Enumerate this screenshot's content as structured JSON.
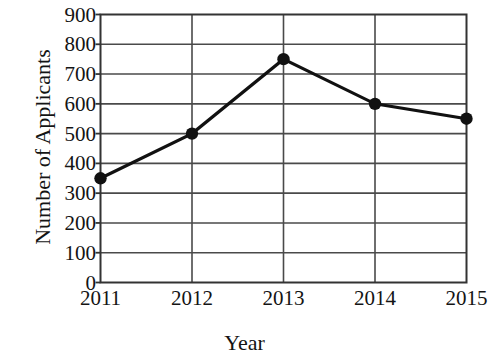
{
  "chart_data": {
    "type": "line",
    "title": "",
    "xlabel": "Year",
    "ylabel": "Number of Applicants",
    "categories": [
      "2011",
      "2012",
      "2013",
      "2014",
      "2015"
    ],
    "values": [
      350,
      500,
      750,
      600,
      550
    ],
    "series": [
      {
        "name": "Number of Applicants",
        "values": [
          350,
          500,
          750,
          600,
          550
        ]
      }
    ],
    "x": [
      2011,
      2012,
      2013,
      2014,
      2015
    ],
    "ylim": [
      0,
      900
    ],
    "ytick_step": 100,
    "yticks": [
      0,
      100,
      200,
      300,
      400,
      500,
      600,
      700,
      800,
      900
    ],
    "ytick_labels": [
      "0",
      "100",
      "200",
      "300",
      "400",
      "500",
      "600",
      "700",
      "800",
      "900"
    ],
    "xtick_labels": [
      "2011",
      "2012",
      "2013",
      "2014",
      "2015"
    ],
    "grid": "both",
    "legend": "none",
    "marker": "filled-circle",
    "line_color": "#111111",
    "marker_color": "#111111",
    "grid_color": "#4a4a4a",
    "axis_color": "#333333",
    "background_color": "#ffffff"
  }
}
